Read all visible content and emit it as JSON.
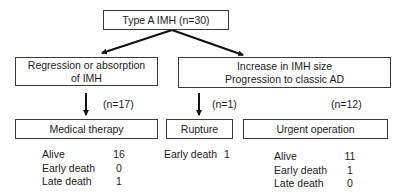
{
  "root": {
    "label": "Type A IMH (n=30)"
  },
  "left_branch": {
    "label_line1": "Regression or absorption",
    "label_line2": "of IMH",
    "count": "(n=17)",
    "outcome": {
      "label": "Medical therapy",
      "stats": [
        {
          "key": "Alive",
          "value": "16"
        },
        {
          "key": "Early death",
          "value": "0"
        },
        {
          "key": "Late death",
          "value": "1"
        }
      ]
    }
  },
  "right_branch": {
    "label_line1": "Increase in IMH size",
    "label_line2": "Progression to classic AD",
    "rupture": {
      "count": "(n=1)",
      "label": "Rupture",
      "stats": [
        {
          "key": "Early death",
          "value": "1"
        }
      ]
    },
    "operation": {
      "count": "(n=12)",
      "label": "Urgent operation",
      "stats": [
        {
          "key": "Alive",
          "value": "11"
        },
        {
          "key": "Early death",
          "value": "1"
        },
        {
          "key": "Late death",
          "value": "0"
        }
      ]
    }
  }
}
